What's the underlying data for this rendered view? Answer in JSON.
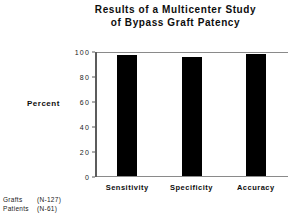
{
  "chart_data": {
    "type": "bar",
    "title": "Results of a Multicenter Study of Bypass Graft Patency",
    "title_lines": [
      "Results of a Multicenter Study",
      "of Bypass Graft Patency"
    ],
    "categories": [
      "Sensitivity",
      "Specificity",
      "Accuracy"
    ],
    "values": [
      97,
      95,
      98
    ],
    "series": [
      {
        "name": "Percent",
        "values": [
          97,
          95,
          98
        ]
      }
    ],
    "xlabel": "",
    "ylabel": "Percent",
    "ylim": [
      0,
      100
    ],
    "yticks": [
      0,
      20,
      40,
      60,
      80,
      100
    ],
    "ytick_labels": [
      "0",
      "20",
      "40",
      "60",
      "80",
      "100"
    ],
    "grid": false,
    "legend": false,
    "bar_color": "#000000",
    "axis_color": "#5c5c5c",
    "annotations": [
      {
        "label": "Grafts",
        "value": "(N-127)"
      },
      {
        "label": "Patients",
        "value": "(N-61)"
      }
    ]
  }
}
